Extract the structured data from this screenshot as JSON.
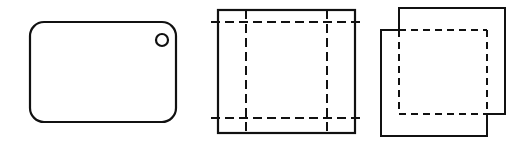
{
  "sheet": {
    "title": "Three orthographic projection views",
    "width": 527,
    "height": 146,
    "background_color": "#ffffff",
    "line_color": "#111111"
  },
  "figures": [
    {
      "id": "rounded-plate-view",
      "name": "rounded-rectangle-plate",
      "description": "Rounded rectangle plate with a single small through-hole near the upper right corner",
      "x": 30,
      "y": 22,
      "width": 146,
      "height": 100,
      "corner_radius": 14,
      "line_style": "solid",
      "hole": {
        "name": "through-hole",
        "center_x": 162,
        "center_y": 40,
        "radius": 6,
        "line_style": "solid"
      }
    },
    {
      "id": "square-with-centerlines-view",
      "name": "square-with-hidden-lines",
      "description": "Square outline with dashed hidden lines forming an inner rectangle, dashes overrunning the left and right edges",
      "x": 218,
      "y": 10,
      "width": 137,
      "height": 123,
      "line_style": "solid",
      "hidden_lines": {
        "line_style": "dashed",
        "inset_left": 28,
        "inset_right": 28,
        "inset_top": 12,
        "inset_bottom": 15,
        "overrun": 7
      }
    },
    {
      "id": "overlapping-squares-view",
      "name": "two-offset-squares",
      "description": "Two equal squares offset diagonally; upper-right square drawn solid on top and right, lower-left square drawn solid on left and bottom, shared overlap edges dashed",
      "upper_square": {
        "name": "upper-right-square",
        "x": 399,
        "y": 8,
        "width": 106,
        "height": 106
      },
      "lower_square": {
        "name": "lower-left-square",
        "x": 381,
        "y": 30,
        "width": 106,
        "height": 106
      },
      "overlap_region": {
        "name": "overlap-rectangle",
        "x": 399,
        "y": 30,
        "width": 88,
        "height": 84,
        "line_style": "dashed"
      }
    }
  ]
}
